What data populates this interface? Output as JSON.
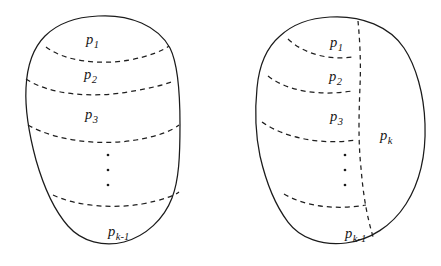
{
  "figure": {
    "background_color": "#ffffff",
    "stroke_color": "#1b1b1b",
    "dash_color": "#1f1f1f"
  },
  "shapes": [
    {
      "id": "left-blob",
      "name": "left-region",
      "description": "Closed blob subdivided by horizontal dashed curves into k-1 strips",
      "partition_count_label": "k-1",
      "labels": [
        {
          "id": "left-p1",
          "base": "p",
          "sub": "1",
          "x": 86,
          "y": 32
        },
        {
          "id": "left-p2",
          "base": "p",
          "sub": "2",
          "x": 84,
          "y": 67
        },
        {
          "id": "left-p3",
          "base": "p",
          "sub": "3",
          "x": 85,
          "y": 107
        },
        {
          "id": "left-pk1",
          "base": "p",
          "sub": "k-1",
          "x": 108,
          "y": 224
        }
      ],
      "ellipsis_dots": [
        {
          "x": 108,
          "y": 155
        },
        {
          "x": 108,
          "y": 170
        },
        {
          "x": 108,
          "y": 185
        }
      ]
    },
    {
      "id": "right-blob",
      "name": "right-region",
      "description": "Same blob with an extra dashed curve splitting off the region p-k on the right",
      "partition_count_label": "k",
      "labels": [
        {
          "id": "right-p1",
          "base": "p",
          "sub": "1",
          "x": 330,
          "y": 35
        },
        {
          "id": "right-p2",
          "base": "p",
          "sub": "2",
          "x": 329,
          "y": 69
        },
        {
          "id": "right-p3",
          "base": "p",
          "sub": "3",
          "x": 330,
          "y": 109
        },
        {
          "id": "right-pk",
          "base": "p",
          "sub": "k",
          "x": 380,
          "y": 128
        },
        {
          "id": "right-pk1",
          "base": "p",
          "sub": "k-1",
          "x": 345,
          "y": 226
        }
      ],
      "ellipsis_dots": [
        {
          "x": 345,
          "y": 155
        },
        {
          "x": 345,
          "y": 170
        },
        {
          "x": 345,
          "y": 185
        }
      ]
    }
  ]
}
